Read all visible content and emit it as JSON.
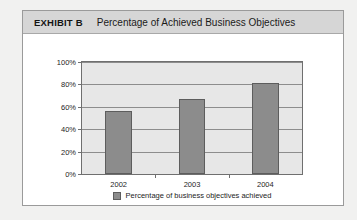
{
  "exhibit": {
    "label": "EXHIBIT B",
    "title": "Percentage of Achieved Business Objectives"
  },
  "colors": {
    "bar_fill": "#8c8c8c",
    "bar_border": "#5d5d5d",
    "plot_background": "#e7e7e7",
    "header_band": "#d6d6d6",
    "panel_background": "#ffffff",
    "page_background": "#f1f1f0",
    "gridline": "#8d8d8d"
  },
  "legend": {
    "position": "bottom-center",
    "entries": [
      {
        "label": "Percentage of business objectives achieved",
        "color": "#8c8c8c"
      }
    ]
  },
  "chart_data": {
    "type": "bar",
    "title": "Percentage of Achieved Business Objectives",
    "xlabel": "",
    "ylabel": "",
    "categories": [
      "2002",
      "2003",
      "2004"
    ],
    "values": [
      56,
      67,
      81
    ],
    "series": [
      {
        "name": "Percentage of business objectives achieved",
        "values": [
          56,
          67,
          81
        ]
      }
    ],
    "ylim": [
      0,
      100
    ],
    "ytick_values": [
      0,
      20,
      40,
      60,
      80,
      100
    ],
    "ytick_labels": [
      "0%",
      "20%",
      "40%",
      "60%",
      "80%",
      "100%"
    ],
    "grid": true,
    "grid_axis": "y",
    "legend_position": "bottom"
  }
}
